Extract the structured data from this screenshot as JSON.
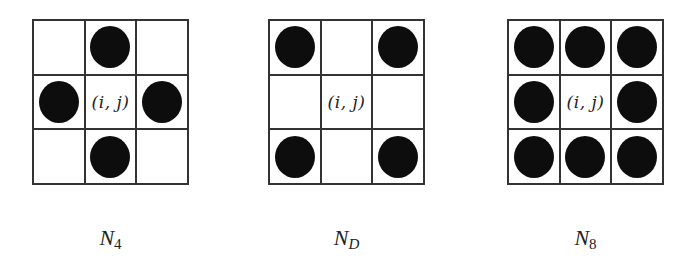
{
  "center_label": "(i, j)",
  "colors": {
    "dot": "#0d0d0d",
    "grid_line": "#333333",
    "background": "#ffffff"
  },
  "panels": [
    {
      "id": "N4",
      "caption": {
        "base": "N",
        "subscript": "4"
      },
      "filled_cells": [
        [
          0,
          1
        ],
        [
          1,
          0
        ],
        [
          1,
          2
        ],
        [
          2,
          1
        ]
      ],
      "grid": [
        [
          0,
          1,
          0
        ],
        [
          1,
          "c",
          1
        ],
        [
          0,
          1,
          0
        ]
      ]
    },
    {
      "id": "ND",
      "caption": {
        "base": "N",
        "subscript": "D"
      },
      "filled_cells": [
        [
          0,
          0
        ],
        [
          0,
          2
        ],
        [
          2,
          0
        ],
        [
          2,
          2
        ]
      ],
      "grid": [
        [
          1,
          0,
          1
        ],
        [
          0,
          "c",
          0
        ],
        [
          1,
          0,
          1
        ]
      ]
    },
    {
      "id": "N8",
      "caption": {
        "base": "N",
        "subscript": "8"
      },
      "filled_cells": [
        [
          0,
          0
        ],
        [
          0,
          1
        ],
        [
          0,
          2
        ],
        [
          1,
          0
        ],
        [
          1,
          2
        ],
        [
          2,
          0
        ],
        [
          2,
          1
        ],
        [
          2,
          2
        ]
      ],
      "grid": [
        [
          1,
          1,
          1
        ],
        [
          1,
          "c",
          1
        ],
        [
          1,
          1,
          1
        ]
      ]
    }
  ]
}
